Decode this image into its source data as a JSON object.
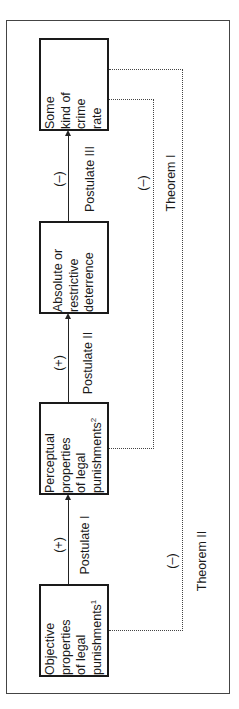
{
  "diagram": {
    "orientation": "rotated-90-ccw",
    "nodes": [
      {
        "id": "crime",
        "lines": [
          "Some",
          "kind of",
          "crime",
          "rate"
        ],
        "sup": ""
      },
      {
        "id": "deterrence",
        "lines": [
          "Absolute or",
          "restrictive",
          "deterrence"
        ],
        "sup": ""
      },
      {
        "id": "perceptual",
        "lines": [
          "Perceptual",
          "properties",
          "of legal",
          "punishments"
        ],
        "sup": "2"
      },
      {
        "id": "objective",
        "lines": [
          "Objective",
          "properties",
          "of legal",
          "punishments"
        ],
        "sup": "1"
      }
    ],
    "edges": [
      {
        "from": "objective",
        "to": "perceptual",
        "label": "Postulate I",
        "sign": "(+)",
        "style": "solid-arrow"
      },
      {
        "from": "perceptual",
        "to": "deterrence",
        "label": "Postulate II",
        "sign": "(+)",
        "style": "solid-arrow"
      },
      {
        "from": "deterrence",
        "to": "crime",
        "label": "Postulate III",
        "sign": "(–)",
        "style": "solid-arrow"
      },
      {
        "from": "perceptual",
        "to": "crime",
        "label": "Theorem I",
        "sign": "(–)",
        "style": "dotted"
      },
      {
        "from": "objective",
        "to": "crime",
        "label": "Theorem II",
        "sign": "(–)",
        "style": "dotted"
      }
    ]
  }
}
